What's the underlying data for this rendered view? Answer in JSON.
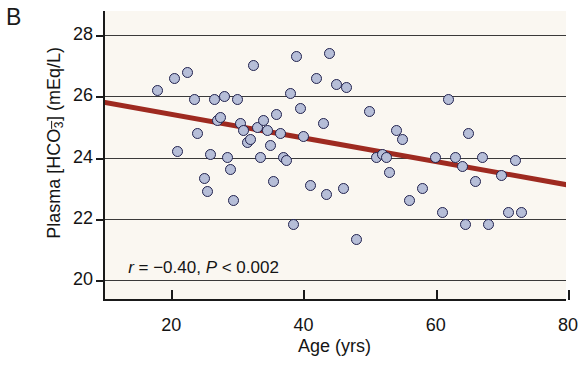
{
  "panel": {
    "letter": "B"
  },
  "chart_data": {
    "type": "scatter",
    "title": "",
    "xlabel": "Age (yrs)",
    "ylabel": "Plasma [HCO3-] (mEq/L)",
    "ylabel_parts": {
      "prefix": "Plasma [HCO",
      "sub": "3",
      "sup": "–",
      "suffix": "] (mEq/L)"
    },
    "xlim": [
      10,
      80
    ],
    "ylim": [
      19.3,
      28.8
    ],
    "xticks": [
      20,
      40,
      60,
      80
    ],
    "yticks": [
      20,
      22,
      24,
      26,
      28
    ],
    "grid": true,
    "grid_axis": "y",
    "legend": null,
    "annotation": {
      "text": "r = -0.40, P < 0.002",
      "r_symbol": "r",
      "r_value": "= −0.40,",
      "p_symbol": "P",
      "p_value": "< 0.002"
    },
    "marker": {
      "fill": "#b6bed8",
      "edge": "#21224e",
      "size_px": 11
    },
    "fit_line": {
      "type": "linear-regression",
      "color": "#9e2a20",
      "x_start": 10,
      "y_start": 25.8,
      "x_end": 80,
      "y_end": 23.1
    },
    "statistics": {
      "r": -0.4,
      "p_text": "< 0.002",
      "n": 66
    },
    "points": [
      [
        18.0,
        26.2
      ],
      [
        20.5,
        26.6
      ],
      [
        21.0,
        24.2
      ],
      [
        22.5,
        26.8
      ],
      [
        23.5,
        25.9
      ],
      [
        24.0,
        24.8
      ],
      [
        25.0,
        23.3
      ],
      [
        25.5,
        22.9
      ],
      [
        26.0,
        24.1
      ],
      [
        26.5,
        25.9
      ],
      [
        27.0,
        25.2
      ],
      [
        27.5,
        25.3
      ],
      [
        28.0,
        26.0
      ],
      [
        28.5,
        24.0
      ],
      [
        29.0,
        23.6
      ],
      [
        29.5,
        22.6
      ],
      [
        30.0,
        25.9
      ],
      [
        30.5,
        25.1
      ],
      [
        31.0,
        24.9
      ],
      [
        31.5,
        24.5
      ],
      [
        32.0,
        24.6
      ],
      [
        32.5,
        27.0
      ],
      [
        33.0,
        25.0
      ],
      [
        33.5,
        24.0
      ],
      [
        34.0,
        25.2
      ],
      [
        34.5,
        24.9
      ],
      [
        35.0,
        24.4
      ],
      [
        35.5,
        23.2
      ],
      [
        36.0,
        25.4
      ],
      [
        36.5,
        24.8
      ],
      [
        37.0,
        24.0
      ],
      [
        37.5,
        23.9
      ],
      [
        38.0,
        26.1
      ],
      [
        38.5,
        21.8
      ],
      [
        39.0,
        27.3
      ],
      [
        39.5,
        25.6
      ],
      [
        40.0,
        24.7
      ],
      [
        41.0,
        23.1
      ],
      [
        42.0,
        26.6
      ],
      [
        43.0,
        25.1
      ],
      [
        43.5,
        22.8
      ],
      [
        44.0,
        27.4
      ],
      [
        45.0,
        26.4
      ],
      [
        46.0,
        23.0
      ],
      [
        46.5,
        26.3
      ],
      [
        48.0,
        21.3
      ],
      [
        50.0,
        25.5
      ],
      [
        51.0,
        24.0
      ],
      [
        52.0,
        24.1
      ],
      [
        52.5,
        24.0
      ],
      [
        53.0,
        23.5
      ],
      [
        54.0,
        24.9
      ],
      [
        55.0,
        24.6
      ],
      [
        56.0,
        22.6
      ],
      [
        58.0,
        23.0
      ],
      [
        60.0,
        24.0
      ],
      [
        61.0,
        22.2
      ],
      [
        62.0,
        25.9
      ],
      [
        63.0,
        24.0
      ],
      [
        64.0,
        23.7
      ],
      [
        64.5,
        21.8
      ],
      [
        65.0,
        24.8
      ],
      [
        66.0,
        23.2
      ],
      [
        67.0,
        24.0
      ],
      [
        68.0,
        21.8
      ],
      [
        70.0,
        23.4
      ],
      [
        71.0,
        22.2
      ],
      [
        72.0,
        23.9
      ],
      [
        73.0,
        22.2
      ]
    ]
  }
}
